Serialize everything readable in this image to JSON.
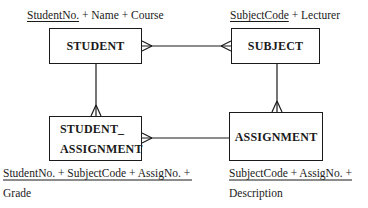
{
  "diagram": {
    "type": "entity-relationship",
    "entities": [
      {
        "id": "student",
        "name": "STUDENT",
        "attributes_label": {
          "key": "StudentNo.",
          "rest": " + Name + Course"
        }
      },
      {
        "id": "subject",
        "name": "SUBJECT",
        "attributes_label": {
          "key": "SubjectCode",
          "rest": " + Lecturer"
        }
      },
      {
        "id": "student_assignment",
        "name_line1": "STUDENT_",
        "name_line2": "ASSIGNMENT",
        "attributes_label": {
          "key": "StudentNo. + SubjectCode + AssigNo. +",
          "rest_line2": "Grade"
        }
      },
      {
        "id": "assignment",
        "name": "ASSIGNMENT",
        "attributes_label": {
          "key": "SubjectCode + AssigNo. +",
          "rest_line2": "Description"
        }
      }
    ],
    "relationships": [
      {
        "from": "STUDENT",
        "to": "SUBJECT",
        "from_cardinality": "many",
        "to_cardinality": "many"
      },
      {
        "from": "STUDENT",
        "to": "STUDENT_ASSIGNMENT",
        "from_cardinality": "one",
        "to_cardinality": "many"
      },
      {
        "from": "SUBJECT",
        "to": "ASSIGNMENT",
        "from_cardinality": "one",
        "to_cardinality": "many"
      },
      {
        "from": "STUDENT_ASSIGNMENT",
        "to": "ASSIGNMENT",
        "from_cardinality": "many",
        "to_cardinality": "one"
      }
    ],
    "line_color": "#1a1a1a"
  }
}
